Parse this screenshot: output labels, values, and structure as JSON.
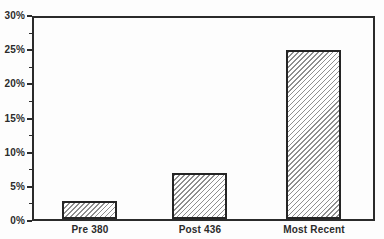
{
  "chart": {
    "background": "#fdfdfd",
    "frame_color": "#2b2b2b",
    "text_color": "#2b2b2b",
    "hatch_color": "#8f8f8f",
    "bar_border_color": "#252525"
  },
  "chart_data": {
    "type": "bar",
    "categories": [
      "Pre 380",
      "Post 436",
      "Most Recent"
    ],
    "values": [
      3,
      7,
      25
    ],
    "title": "",
    "xlabel": "",
    "ylabel": "",
    "ylim": [
      0,
      30
    ],
    "ytick_labels": [
      "0%",
      "5%",
      "10%",
      "15%",
      "20%",
      "25%",
      "30%"
    ],
    "ytick_values": [
      0,
      5,
      10,
      15,
      20,
      25,
      30
    ],
    "minor_ytick_values": [
      2.5,
      7.5,
      12.5,
      17.5,
      22.5,
      27.5
    ],
    "grid": "off",
    "legend": "none",
    "bar_style": "diagonal-hatch"
  }
}
